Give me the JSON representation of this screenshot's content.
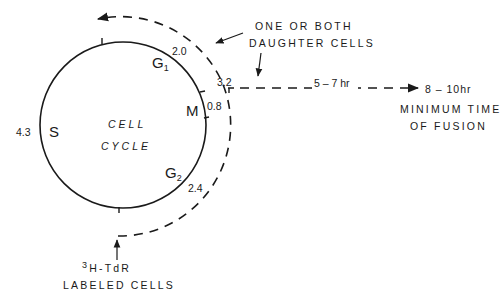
{
  "diagram": {
    "center_title": [
      "CELL",
      "CYCLE"
    ],
    "phases": [
      {
        "name": "G",
        "sub": "1",
        "duration": "2.0"
      },
      {
        "name": "M",
        "sub": "",
        "duration": "0.8"
      },
      {
        "name": "G",
        "sub": "2",
        "duration": "2.4"
      },
      {
        "name": "S",
        "sub": "",
        "duration": "4.3"
      }
    ],
    "marker_value": "3.2",
    "daughter_label": [
      "ONE OR BOTH",
      "DAUGHTER CELLS"
    ],
    "interval_label": "5 – 7 hr",
    "fusion_time": "8 – 10hr",
    "fusion_label": [
      "MINIMUM TIME",
      "OF FUSION"
    ],
    "labeled_cells": {
      "sup": "3",
      "line1": "H-TdR",
      "line2": "LABELED CELLS"
    }
  }
}
